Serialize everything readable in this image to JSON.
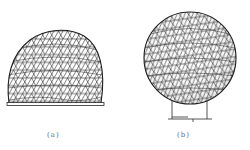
{
  "figure": {
    "background": "#ffffff",
    "line_color": "#2a2a2a",
    "panels": [
      {
        "id": "a",
        "caption": "(a)",
        "description": "geodesic-dome-truncated-sphere-on-base"
      },
      {
        "id": "b",
        "caption": "(b)",
        "description": "geodesic-sphere-on-two-supports"
      }
    ]
  }
}
